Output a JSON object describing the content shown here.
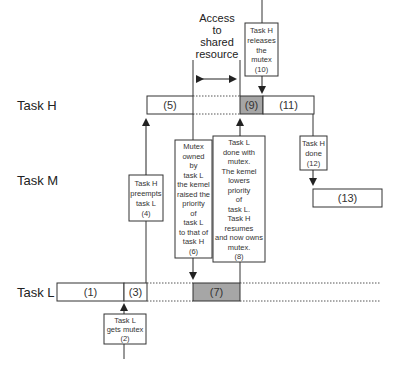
{
  "diagram": {
    "tasks": [
      {
        "id": "H",
        "label": "Task H"
      },
      {
        "id": "M",
        "label": "Task M"
      },
      {
        "id": "L",
        "label": "Task L"
      }
    ],
    "access_label": [
      "Access",
      "to",
      "shared",
      "resource"
    ],
    "segments": {
      "s1": "(1)",
      "s3": "(3)",
      "s5": "(5)",
      "s7": "(7)",
      "s9": "(9)",
      "s11": "(11)",
      "s13": "(13)"
    },
    "notes": {
      "n2": [
        "Task L",
        "gets mutex",
        "(2)"
      ],
      "n4": [
        "Task H",
        "preempts",
        "task L",
        "(4)"
      ],
      "n6": [
        "Mutex",
        "owned",
        "by",
        "task L",
        "the kemel",
        "raised the",
        "priority",
        "of",
        "task L",
        "to that of",
        "task H",
        "(6)"
      ],
      "n8": [
        "Task L",
        "done with",
        "mutex.",
        "The kemel",
        "lowers",
        "priority",
        "of",
        "task L.",
        "Task H",
        "resumes",
        "and now owns",
        "mutex.",
        "(8)"
      ],
      "n10": [
        "Task H",
        "releases",
        "the",
        "mutex",
        "(10)"
      ],
      "n12": [
        "Task H",
        "done",
        "(12)"
      ]
    },
    "colors": {
      "line": "#333333",
      "box_fill": "#ffffff",
      "shared_fill": "#a6a6a6",
      "dotted": "#555555"
    }
  }
}
